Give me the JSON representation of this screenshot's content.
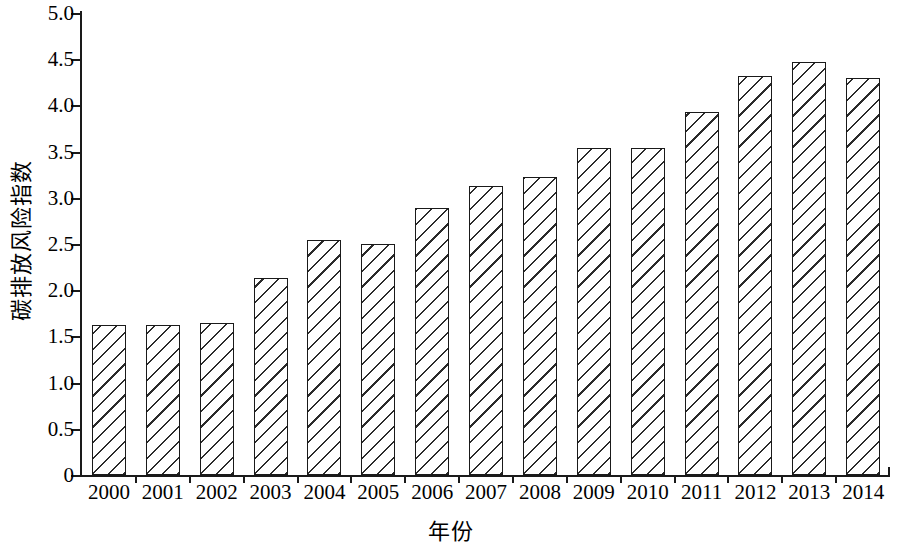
{
  "chart_data": {
    "type": "bar",
    "title": "",
    "xlabel": "年份",
    "ylabel": "碳排放风险指数",
    "categories": [
      "2000",
      "2001",
      "2002",
      "2003",
      "2004",
      "2005",
      "2006",
      "2007",
      "2008",
      "2009",
      "2010",
      "2011",
      "2012",
      "2013",
      "2014"
    ],
    "values": [
      1.62,
      1.62,
      1.64,
      2.13,
      2.54,
      2.5,
      2.89,
      3.13,
      3.22,
      3.54,
      3.54,
      3.93,
      4.32,
      4.47,
      4.3
    ],
    "ylim": [
      0,
      5.0
    ],
    "yticks": [
      0,
      0.5,
      1.0,
      1.5,
      2.0,
      2.5,
      3.0,
      3.5,
      4.0,
      4.5,
      5.0
    ],
    "ytick_labels": [
      "0",
      "0.5",
      "1.0",
      "1.5",
      "2.0",
      "2.5",
      "3.0",
      "3.5",
      "4.0",
      "4.5",
      "5.0"
    ],
    "grid": false,
    "legend": null,
    "bar_style": {
      "fill": "#ffffff",
      "edge_color": "#1a1a1a",
      "hatch": "\\\\",
      "hatch_color": "#2b2b2b"
    }
  }
}
